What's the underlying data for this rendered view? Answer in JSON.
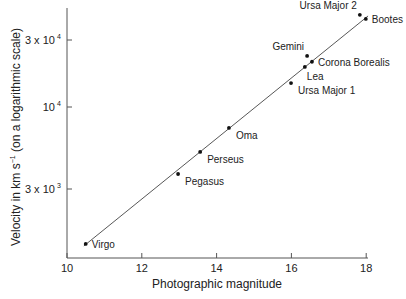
{
  "chart_data": {
    "type": "scatter",
    "title": "",
    "xlabel": "Photographic magnitude",
    "ylabel": "Velocity in km s⁻¹ (on a logarithmic scale)",
    "ylabel_parts": {
      "main": "Velocity in km s",
      "sup": "−1",
      "tail": " (on a logarithmic scale)"
    },
    "xlim": [
      10,
      18
    ],
    "yscale": "log",
    "xticks": [
      {
        "value": 10,
        "label": "10"
      },
      {
        "value": 12,
        "label": "12"
      },
      {
        "value": 14,
        "label": "14"
      },
      {
        "value": 16,
        "label": "16"
      },
      {
        "value": 18,
        "label": "18"
      }
    ],
    "yticks": [
      {
        "value": 3000,
        "mantissa": "3 x 10",
        "exp": "3"
      },
      {
        "value": 10000,
        "mantissa": "10",
        "exp": "4"
      },
      {
        "value": 30000,
        "mantissa": "3 x 10",
        "exp": "4"
      }
    ],
    "grid": false,
    "points": [
      {
        "name": "Virgo",
        "x": 10.5,
        "y": 1340,
        "label_pos": "right"
      },
      {
        "name": "Pegasus",
        "x": 12.97,
        "y": 3740,
        "label_pos": "right-below"
      },
      {
        "name": "Perseus",
        "x": 13.56,
        "y": 5170,
        "label_pos": "right-below"
      },
      {
        "name": "Oma",
        "x": 14.33,
        "y": 7350,
        "label_pos": "right-below"
      },
      {
        "name": "Ursa Major 1",
        "x": 15.99,
        "y": 14800,
        "label_pos": "right-below"
      },
      {
        "name": "Lea",
        "x": 16.36,
        "y": 19300,
        "label_pos": "below"
      },
      {
        "name": "Gemini",
        "x": 16.42,
        "y": 23100,
        "label_pos": "above-left"
      },
      {
        "name": "Corona Borealis",
        "x": 16.55,
        "y": 21000,
        "label_pos": "right"
      },
      {
        "name": "Ursa Major 2",
        "x": 17.83,
        "y": 45300,
        "label_pos": "above-left"
      },
      {
        "name": "Bootes",
        "x": 17.99,
        "y": 42400,
        "label_pos": "right"
      }
    ],
    "fit_line": {
      "x_start": 10.45,
      "y_start": 1300,
      "x_end": 18.05,
      "y_end": 44500
    }
  }
}
